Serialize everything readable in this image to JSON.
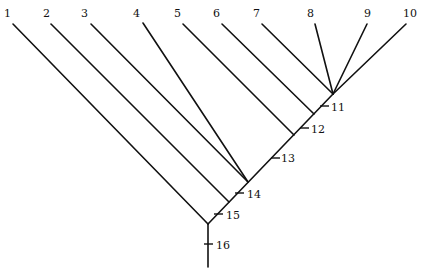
{
  "diagram": {
    "type": "cladogram",
    "taxa": [
      "1",
      "2",
      "3",
      "4",
      "5",
      "6",
      "7",
      "8",
      "9",
      "10"
    ],
    "node_labels": [
      "11",
      "12",
      "13",
      "14",
      "15",
      "16"
    ]
  }
}
